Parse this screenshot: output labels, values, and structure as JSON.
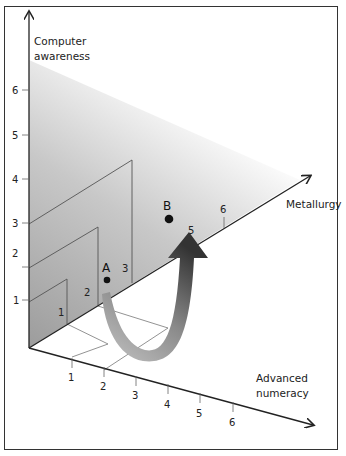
{
  "diagram": {
    "type": "3d-axes-skills-diagram",
    "axes": {
      "vertical": {
        "label_line1": "Computer",
        "label_line2": "awareness",
        "ticks": [
          "1",
          "2",
          "3",
          "4",
          "5",
          "6"
        ]
      },
      "depth": {
        "label": "Metallurgy",
        "ticks": [
          "1",
          "2",
          "3",
          "5",
          "6"
        ]
      },
      "horizontal": {
        "label_line1": "Advanced",
        "label_line2": "numeracy",
        "ticks": [
          "1",
          "2",
          "3",
          "4",
          "5",
          "6"
        ]
      }
    },
    "points": [
      {
        "label": "A"
      },
      {
        "label": "B"
      }
    ],
    "arrow": {
      "from": "A",
      "to": "B",
      "style": "curved-gradient"
    },
    "colors": {
      "plane_shade": "#9a9a9a",
      "arrow_dark": "#3a3a3a",
      "arrow_light": "#bdbdbd",
      "axis": "#222222"
    }
  }
}
